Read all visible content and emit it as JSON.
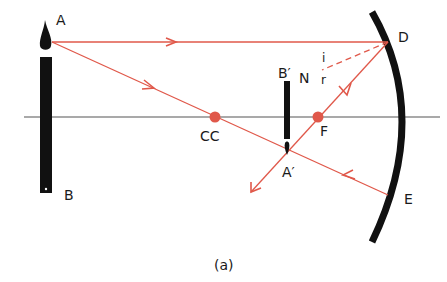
{
  "diagram": {
    "type": "concave-mirror-ray-diagram",
    "caption": "(a)",
    "colors": {
      "ray": "#e0584a",
      "object": "#111111",
      "axis": "#555555",
      "mirror": "#111111",
      "point": "#e0584a"
    },
    "labels": {
      "object_top": "A",
      "object_bottom": "B",
      "image_top": "B′",
      "image_bottom": "A′",
      "normal": "N",
      "incidence_angle": "i",
      "reflection_angle": "r",
      "mirror_top_point": "D",
      "mirror_bottom_point": "E",
      "focus": "F",
      "centre_of_curvature": "CC"
    },
    "points": {
      "A": [
        52,
        42
      ],
      "B": [
        45,
        192
      ],
      "D": [
        388,
        42
      ],
      "E": [
        388,
        195
      ],
      "F": [
        318,
        117
      ],
      "CC": [
        215,
        117
      ],
      "A_prime": [
        287,
        150
      ],
      "B_prime": [
        287,
        96
      ]
    },
    "rays": [
      {
        "name": "parallel-ray",
        "from": "A",
        "to": "D"
      },
      {
        "name": "ray-through-centre",
        "from": "A",
        "to": "E",
        "via": "CC"
      },
      {
        "name": "reflected-through-focus",
        "from": "D",
        "to": "beyond-A_prime",
        "via": "F"
      },
      {
        "name": "normal-at-D",
        "from": "D",
        "toward": "N",
        "style": "dashed"
      }
    ]
  }
}
